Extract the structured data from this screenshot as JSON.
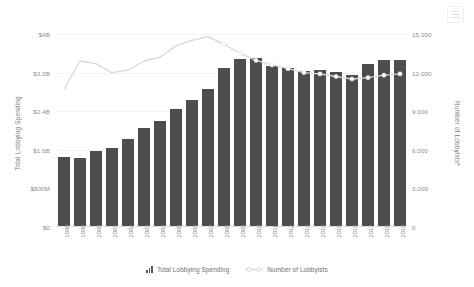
{
  "toolbar": {
    "menu_label": "menu-icon"
  },
  "chart_data": {
    "type": "bar",
    "title": "",
    "subtitle": "",
    "xlabel": "",
    "ylabel": "Total Lobbying Spending",
    "y2label": "Number of Lobbyists*",
    "grid": true,
    "legend_position": "bottom",
    "categories": [
      "1998",
      "1999",
      "2000",
      "2001",
      "2002",
      "2003",
      "2004",
      "2005",
      "2006",
      "2007",
      "2008",
      "2009",
      "2010",
      "2011",
      "2012",
      "2013",
      "2014",
      "2015",
      "2016",
      "2017",
      "2018",
      "2019"
    ],
    "ylim": [
      0,
      4000000000
    ],
    "y2lim": [
      0,
      15000
    ],
    "yticks": [
      "$0",
      "$800M",
      "$1.6B",
      "$2.4B",
      "$3.2B",
      "$4B"
    ],
    "ytick_values": [
      0,
      800000000,
      1600000000,
      2400000000,
      3200000000,
      4000000000
    ],
    "y2ticks": [
      "0",
      "3,000",
      "6,000",
      "9,000",
      "12,000",
      "15,000"
    ],
    "y2tick_values": [
      0,
      3000,
      6000,
      9000,
      12000,
      15000
    ],
    "series": [
      {
        "name": "Total Lobbying Spending",
        "type": "bar",
        "axis": "left",
        "color": "#4d4d4d",
        "values": [
          1450000000,
          1440000000,
          1570000000,
          1630000000,
          1830000000,
          2060000000,
          2190000000,
          2440000000,
          2630000000,
          2870000000,
          3300000000,
          3490000000,
          3510000000,
          3330000000,
          3300000000,
          3240000000,
          3260000000,
          3220000000,
          3150000000,
          3380000000,
          3460000000,
          3470000000
        ]
      },
      {
        "name": "Number of Lobbyists",
        "type": "line",
        "axis": "right",
        "color": "#d8d8d8",
        "marker_color": "#ffffff",
        "values": [
          10700,
          12900,
          12700,
          12000,
          12200,
          12900,
          13200,
          14100,
          14500,
          14800,
          14200,
          13500,
          12950,
          12600,
          12300,
          12000,
          11900,
          11700,
          11500,
          11600,
          11800,
          11900
        ]
      }
    ],
    "legend": [
      {
        "label": "Total Lobbying Spending",
        "icon": "bar-chart-icon",
        "color": "#555555"
      },
      {
        "label": "Number of Lobbyists",
        "icon": "line-marker-icon",
        "color": "#d8d8d8"
      }
    ]
  }
}
